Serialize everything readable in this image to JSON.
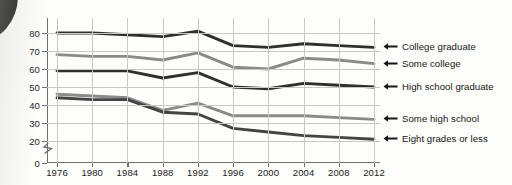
{
  "chart_data": {
    "type": "line",
    "title": "",
    "subtitle": "",
    "xlabel": "",
    "ylabel": "",
    "x": [
      1976,
      1980,
      1984,
      1988,
      1992,
      1996,
      2000,
      2004,
      2008,
      2012
    ],
    "xtick_labels": [
      "1976",
      "1980",
      "1984",
      "1988",
      "1992",
      "1996",
      "2000",
      "2004",
      "2008",
      "2012"
    ],
    "ytick_labels": [
      "0",
      "20",
      "30",
      "40",
      "50",
      "60",
      "70",
      "80"
    ],
    "ytick_values": [
      0,
      20,
      30,
      40,
      50,
      60,
      70,
      80
    ],
    "ylim": [
      20,
      85
    ],
    "axis_break": true,
    "axis_break_between": [
      0,
      20
    ],
    "grid": true,
    "grid_axis": "both",
    "legend_position": "right",
    "series": [
      {
        "name": "College graduate",
        "color": "#2f2f2f",
        "values": [
          80,
          80,
          79,
          78,
          81,
          73,
          72,
          74,
          73,
          72
        ]
      },
      {
        "name": "Some college",
        "color": "#8a8a8a",
        "values": [
          68,
          67,
          67,
          65,
          69,
          61,
          60,
          66,
          65,
          63
        ]
      },
      {
        "name": "High school graduate",
        "color": "#2f2f2f",
        "values": [
          59,
          59,
          59,
          55,
          58,
          50,
          49,
          52,
          51,
          50
        ]
      },
      {
        "name": "Some high school",
        "color": "#8a8a8a",
        "values": [
          46,
          45,
          44,
          37,
          41,
          34,
          34,
          34,
          33,
          32
        ]
      },
      {
        "name": "Eight grades or less",
        "color": "#444444",
        "values": [
          44,
          43,
          43,
          36,
          35,
          27,
          25,
          23,
          22,
          21
        ]
      }
    ]
  },
  "legend": {
    "items": [
      {
        "label": "College graduate",
        "icon": "left-arrow-icon"
      },
      {
        "label": "Some college",
        "icon": "left-arrow-icon"
      },
      {
        "label": "High school graduate",
        "icon": "left-arrow-icon"
      },
      {
        "label": "Some high school",
        "icon": "left-arrow-icon"
      },
      {
        "label": "Eight grades or less",
        "icon": "left-arrow-icon"
      }
    ]
  }
}
